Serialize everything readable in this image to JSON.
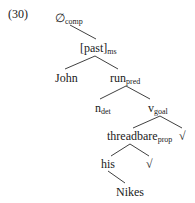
{
  "example_number": "(30)",
  "tree": {
    "root": {
      "label": "∅",
      "sub": "comp"
    },
    "tense": {
      "label": "[past]",
      "sub": "ms"
    },
    "subject": {
      "label": "John"
    },
    "predicate": {
      "label": "run",
      "sub": "pred"
    },
    "determiner": {
      "label": "n",
      "sub": "det"
    },
    "goal": {
      "label": "v",
      "sub": "goal"
    },
    "property": {
      "label": "threadbare",
      "sub": "prop"
    },
    "root_sym_1": {
      "label": "√"
    },
    "possessor": {
      "label": "his"
    },
    "root_sym_2": {
      "label": "√"
    },
    "object": {
      "label": "Nikes"
    }
  }
}
